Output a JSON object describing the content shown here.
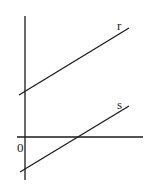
{
  "diagram": {
    "axes": {
      "origin_label": "0",
      "y_axis": {
        "x": 25,
        "y1": 16,
        "y2": 180
      },
      "x_axis": {
        "y": 137,
        "x1": 17,
        "x2": 143
      }
    },
    "lines": [
      {
        "name": "r",
        "label": "r",
        "x1": 19,
        "y1": 95,
        "x2": 129,
        "y2": 28,
        "label_x": 117,
        "label_y": 30
      },
      {
        "name": "s",
        "label": "s",
        "x1": 20,
        "y1": 172,
        "x2": 129,
        "y2": 106,
        "label_x": 117,
        "label_y": 109
      }
    ],
    "colors": {
      "stroke": "#1a1a1a",
      "background": "#ffffff"
    }
  }
}
